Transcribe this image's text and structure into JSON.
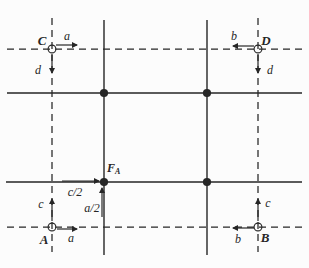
{
  "figure": {
    "background": "#fcfcfc",
    "ink": "#262626",
    "labels": {
      "site_c": "C",
      "site_d": "D",
      "site_a": "A",
      "site_b": "B",
      "f_site_main": "F",
      "f_site_sub": "A",
      "vec_a_top": "a",
      "vec_d_topleft": "d",
      "vec_b_top": "b",
      "vec_d_topright": "d",
      "vec_c_bottomleft": "c",
      "vec_a_bottom": "a",
      "vec_c_bottomright": "c",
      "vec_b_bottom": "b",
      "half_c": "c/2",
      "half_a": "a/2"
    },
    "points": {
      "filled": [
        [
          104,
          93
        ],
        [
          207,
          93
        ],
        [
          104,
          182
        ],
        [
          207,
          182
        ]
      ],
      "open": [
        [
          52,
          49
        ],
        [
          258,
          49
        ],
        [
          52,
          227
        ],
        [
          258,
          227
        ]
      ]
    }
  }
}
